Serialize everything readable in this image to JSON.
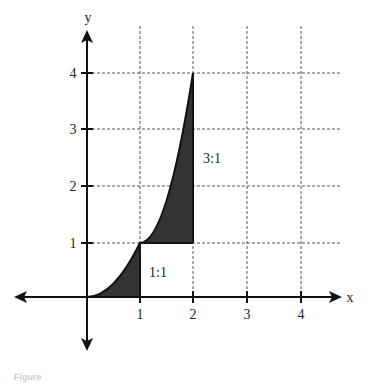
{
  "figure": {
    "axes": {
      "x_label": "x",
      "y_label": "y",
      "x_ticks": [
        "1",
        "2",
        "3",
        "4"
      ],
      "y_ticks": [
        "1",
        "2",
        "3",
        "4"
      ]
    },
    "curve": {
      "description": "increasing curve through (0,0), (1,1), (2,4)",
      "points": [
        [
          0,
          0
        ],
        [
          0.5,
          0.25
        ],
        [
          1,
          1
        ],
        [
          1.5,
          2.25
        ],
        [
          2,
          4
        ]
      ]
    },
    "regions": [
      {
        "label": "1:1",
        "description": "area under curve from x=0 to x=1",
        "fill": "#333333"
      },
      {
        "label": "3:1",
        "description": "area between curve and y=1 from x=1 to x=2",
        "fill": "#333333"
      }
    ],
    "grid": {
      "style": "dashed",
      "color": "#555555"
    },
    "caption": "Figure"
  }
}
